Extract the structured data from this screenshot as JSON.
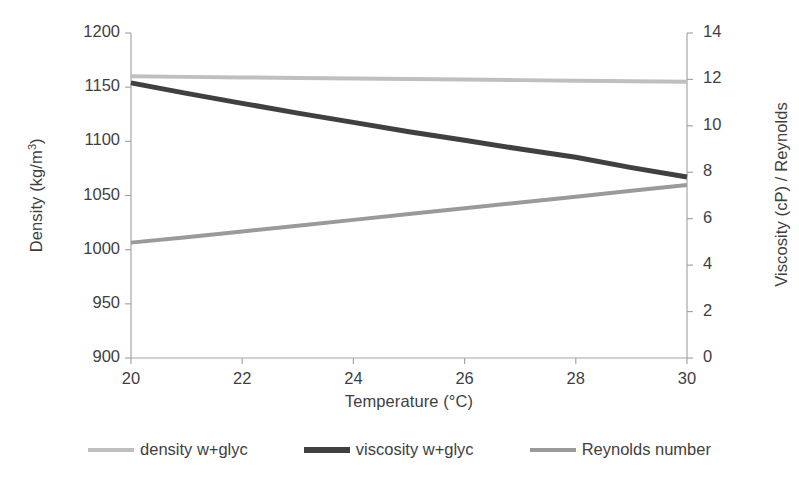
{
  "chart_data": {
    "type": "line",
    "title": "",
    "xlabel": "Temperature (°C)",
    "ylabel": "Density (kg/m",
    "ylabel_sup": "3",
    "ylabel_tail": ")",
    "ylabel_right": "Viscosity (cP) / Reynolds",
    "x": [
      20,
      21,
      22,
      23,
      24,
      25,
      26,
      27,
      28,
      29,
      30
    ],
    "xlim": [
      20,
      30
    ],
    "xticks": [
      "20",
      "22",
      "24",
      "26",
      "28",
      "30"
    ],
    "xtick_values": [
      20,
      22,
      24,
      26,
      28,
      30
    ],
    "ylim": [
      900,
      1200
    ],
    "yticks": [
      "900",
      "950",
      "1000",
      "1050",
      "1100",
      "1150",
      "1200"
    ],
    "ytick_values": [
      900,
      950,
      1000,
      1050,
      1100,
      1150,
      1200
    ],
    "ylim_right": [
      0,
      14
    ],
    "yticks_right": [
      "0",
      "2",
      "4",
      "6",
      "8",
      "10",
      "12",
      "14"
    ],
    "ytick_values_right": [
      0,
      2,
      4,
      6,
      8,
      10,
      12,
      14
    ],
    "grid": false,
    "legend_position": "bottom",
    "series": [
      {
        "name": "density w+glyc",
        "axis": "left",
        "color": "#bfbfbf",
        "width": 4,
        "values": [
          1160,
          1159.5,
          1159,
          1158.5,
          1158,
          1157.5,
          1157,
          1156.5,
          1156,
          1155.5,
          1155
        ]
      },
      {
        "name": "viscosity w+glyc",
        "axis": "right",
        "color": "#404040",
        "width": 5,
        "values": [
          11.85,
          11.4,
          10.97,
          10.55,
          10.15,
          9.75,
          9.38,
          9.0,
          8.65,
          8.2,
          7.8
        ]
      },
      {
        "name": "Reynolds number",
        "axis": "right",
        "color": "#9a9a9a",
        "width": 4,
        "values": [
          4.97,
          5.2,
          5.45,
          5.7,
          5.95,
          6.2,
          6.45,
          6.7,
          6.95,
          7.2,
          7.45
        ]
      }
    ]
  },
  "axis_style": {
    "axis_color": "#a6a6a6",
    "text_color": "#3f3f3f"
  }
}
